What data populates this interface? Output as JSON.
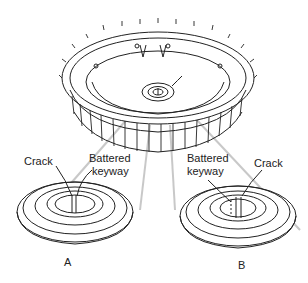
{
  "diagram": {
    "views": [
      {
        "id": "A",
        "caption": "A",
        "labels": [
          "Crack",
          "Battered keyway"
        ]
      },
      {
        "id": "B",
        "caption": "B",
        "labels": [
          "Battered keyway",
          "Crack"
        ]
      }
    ]
  },
  "labels": {
    "a_crack": "Crack",
    "a_battered_1": "Battered",
    "a_battered_2": "keyway",
    "a_caption": "A",
    "b_battered_1": "Battered",
    "b_battered_2": "keyway",
    "b_crack": "Crack",
    "b_caption": "B"
  },
  "colors": {
    "line": "#222222",
    "ghost": "#cccccc",
    "bg": "#ffffff"
  }
}
